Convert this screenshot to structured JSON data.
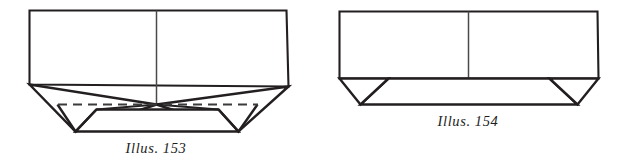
{
  "page": {
    "background_color": "#ffffff",
    "ink_color": "#231f20"
  },
  "figures": [
    {
      "id": "illus-153",
      "caption": "Illus. 153",
      "line_color": "#231f20",
      "has_dashed_fold_line": true,
      "dashed_line_color": "#3b3b3b"
    },
    {
      "id": "illus-154",
      "caption": "Illus. 154",
      "line_color": "#231f20",
      "has_dashed_fold_line": false,
      "dashed_line_color": "#3b3b3b"
    }
  ]
}
